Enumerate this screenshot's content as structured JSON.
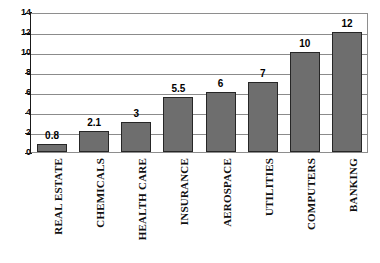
{
  "chart_data": {
    "type": "bar",
    "title": "",
    "subtitle": "",
    "xlabel": "",
    "ylabel": "",
    "categories": [
      "REAL ESTATE",
      "CHEMICALS",
      "HEALTH CARE",
      "INSURANCE",
      "AEROSPACE",
      "UTILITIES",
      "COMPUTERS",
      "BANKING"
    ],
    "values": [
      0.8,
      2.1,
      3,
      5.5,
      6,
      7,
      10,
      12
    ],
    "value_labels": [
      "0.8",
      "2.1",
      "3",
      "5.5",
      "6",
      "7",
      "10",
      "12"
    ],
    "ylim": [
      0,
      14
    ],
    "ytick_values": [
      0,
      2,
      4,
      6,
      8,
      10,
      12,
      14
    ],
    "ytick_labels": [
      "0",
      "2",
      "4",
      "6",
      "8",
      "10",
      "12",
      "14"
    ],
    "grid": true,
    "grid_axis": "y",
    "legend": false,
    "legend_position": "none",
    "bar_fill_color": "#6e6e6e",
    "bar_border_color": "#262626",
    "gridline_color": "#8b8b8b",
    "axis_color": "#1a1a1a",
    "plot_background": "#ffffff",
    "label_rotation": 90
  }
}
